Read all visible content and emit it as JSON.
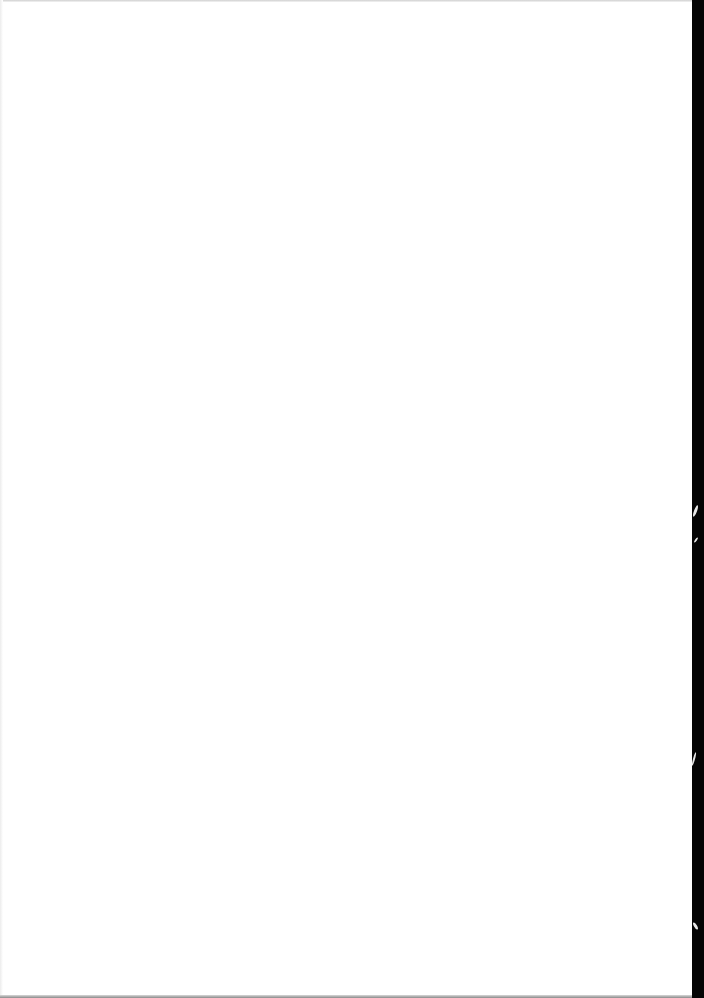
{
  "document": {
    "type": "scanned-page",
    "content": "",
    "colors": {
      "page": "#ffffff",
      "scan_border": "#050505",
      "edge_shadow": "#cfcfcf"
    }
  }
}
